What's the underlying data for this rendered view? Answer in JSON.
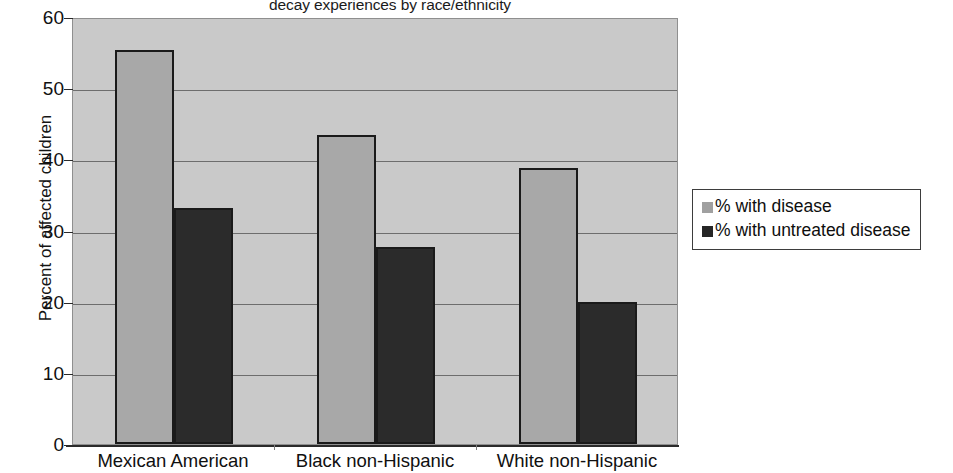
{
  "chart_data": {
    "type": "bar",
    "title": "decay experiences by race/ethnicity",
    "xlabel": "",
    "ylabel": "Percent of affected children",
    "ylim": [
      0,
      60
    ],
    "ytick_values": [
      0,
      10,
      20,
      30,
      40,
      50,
      60
    ],
    "ytick_labels": [
      "0",
      "10",
      "20",
      "30",
      "40",
      "50",
      "60"
    ],
    "grid": true,
    "legend_position": "right",
    "categories": [
      "Mexican American",
      "Black non-Hispanic",
      "White non-Hispanic"
    ],
    "series": [
      {
        "name": "% with disease",
        "color": "#a8a8a8",
        "values": [
          55.4,
          43.4,
          38.8
        ]
      },
      {
        "name": "% with untreated disease",
        "color": "#2b2b2b",
        "values": [
          33.2,
          27.7,
          19.9
        ]
      }
    ]
  },
  "legend": {
    "items": [
      {
        "label": "% with disease",
        "swatch": "light"
      },
      {
        "label": "% with untreated disease",
        "swatch": "dark"
      }
    ]
  },
  "colors": {
    "plot_background": "#c9c9c9",
    "series_light": "#a8a8a8",
    "series_dark": "#2b2b2b",
    "gridline": "#6d6d6d",
    "axis": "#2a2a2a"
  }
}
